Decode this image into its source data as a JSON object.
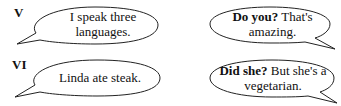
{
  "exercises": [
    {
      "label": "V",
      "left_bubble": {
        "lines": [
          "I speak three",
          "languages."
        ]
      },
      "right_bubble": {
        "bold": "Do you?",
        "rest_line1": " That's",
        "line2": "amazing."
      }
    },
    {
      "label": "VI",
      "left_bubble": {
        "lines": [
          "Linda ate steak."
        ]
      },
      "right_bubble": {
        "bold": "Did she?",
        "rest_line1": " But she's a",
        "line2": "vegetarian."
      }
    }
  ]
}
